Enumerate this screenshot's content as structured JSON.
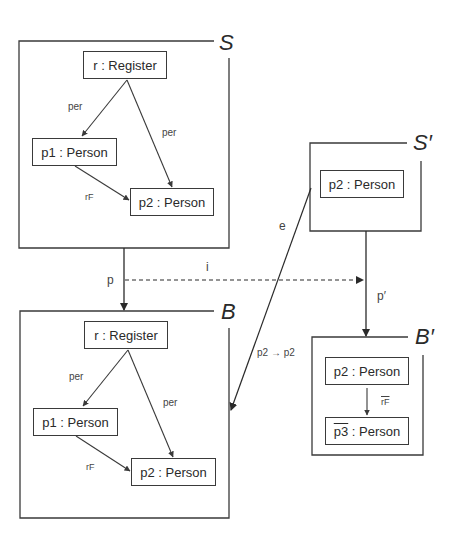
{
  "graphs": {
    "S": {
      "label": "S",
      "nodes": [
        {
          "id": "r",
          "label": "r : Register"
        },
        {
          "id": "p1",
          "label": "p1 : Person"
        },
        {
          "id": "p2",
          "label": "p2 : Person"
        }
      ],
      "edges": [
        {
          "from": "r",
          "to": "p1",
          "label": "per"
        },
        {
          "from": "r",
          "to": "p2",
          "label": "per"
        },
        {
          "from": "p1",
          "to": "p2",
          "label": "rF"
        }
      ]
    },
    "S_prime": {
      "label": "S′",
      "nodes": [
        {
          "id": "p2",
          "label": "p2 : Person"
        }
      ]
    },
    "B": {
      "label": "B",
      "nodes": [
        {
          "id": "r",
          "label": "r : Register"
        },
        {
          "id": "p1",
          "label": "p1 : Person"
        },
        {
          "id": "p2",
          "label": "p2 : Person"
        }
      ],
      "edges": [
        {
          "from": "r",
          "to": "p1",
          "label": "per"
        },
        {
          "from": "r",
          "to": "p2",
          "label": "per"
        },
        {
          "from": "p1",
          "to": "p2",
          "label": "rF"
        }
      ]
    },
    "B_prime": {
      "label": "B′",
      "nodes": [
        {
          "id": "p2",
          "label": "p2 : Person"
        },
        {
          "id": "p3",
          "label_var": "p3",
          "label_rest": " : Person"
        }
      ],
      "edges": [
        {
          "from": "p2",
          "to": "p3",
          "label": "rF"
        }
      ]
    }
  },
  "morphisms": {
    "p": {
      "label": "p",
      "from": "S",
      "to": "B"
    },
    "i": {
      "label": "i",
      "from": "S",
      "to": "S_prime",
      "style": "dashed"
    },
    "p_prime": {
      "label": "p′",
      "from": "S_prime",
      "to": "B_prime"
    },
    "e": {
      "label": "e",
      "from": "S_prime",
      "to": "B",
      "mapping": "p2 → p2"
    }
  }
}
